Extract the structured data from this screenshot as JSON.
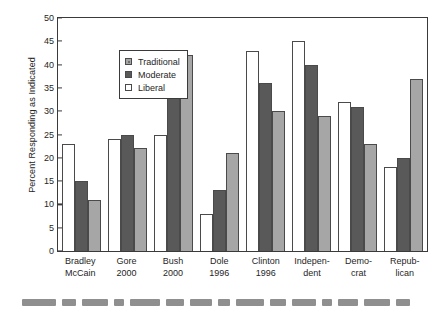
{
  "chart_data": {
    "type": "bar",
    "title": "",
    "xlabel": "",
    "ylabel": "Percent Responding as Indicated",
    "ylim": [
      0,
      50
    ],
    "ytick_step": 5,
    "yticks": [
      "0",
      "5",
      "10",
      "15",
      "20",
      "25",
      "30",
      "35",
      "40",
      "45",
      "50"
    ],
    "grid": false,
    "legend_position": "upper-left-inside",
    "categories": [
      "Bradley McCain",
      "Gore 2000",
      "Bush 2000",
      "Dole 1996",
      "Clinton 1996",
      "Independent",
      "Democrat",
      "Republican"
    ],
    "category_lines": [
      [
        "Bradley",
        "McCain"
      ],
      [
        "Gore",
        "2000"
      ],
      [
        "Bush",
        "2000"
      ],
      [
        "Dole",
        "1996"
      ],
      [
        "Clinton",
        "1996"
      ],
      [
        "Indepen-",
        "dent"
      ],
      [
        "Demo-",
        "crat"
      ],
      [
        "Repub-",
        "lican"
      ]
    ],
    "series": [
      {
        "name": "Liberal",
        "color": "#ffffff",
        "values": [
          23,
          24,
          25,
          8,
          43,
          45,
          32,
          18
        ]
      },
      {
        "name": "Moderate",
        "color": "#595959",
        "values": [
          15,
          25,
          36,
          13,
          36,
          40,
          31,
          20
        ]
      },
      {
        "name": "Traditional",
        "color": "#a6a6a6",
        "values": [
          11,
          22,
          42,
          21,
          30,
          29,
          23,
          37
        ]
      }
    ],
    "legend_order": [
      "Traditional",
      "Moderate",
      "Liberal"
    ]
  },
  "legend": {
    "items": [
      {
        "label": "Traditional",
        "swatch": "traditional"
      },
      {
        "label": "Moderate",
        "swatch": "moderate"
      },
      {
        "label": "Liberal",
        "swatch": "liberal"
      }
    ]
  },
  "axes": {
    "y_title": "Percent Responding as Indicated"
  }
}
